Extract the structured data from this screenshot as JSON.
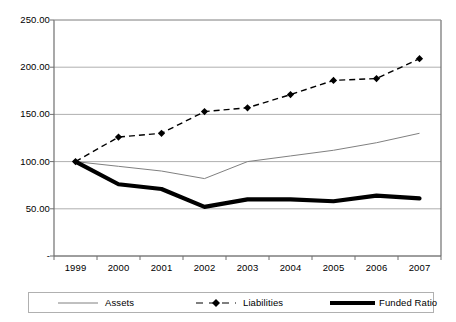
{
  "chart_data": {
    "type": "line",
    "title": "",
    "xlabel": "",
    "ylabel": "",
    "categories": [
      "1999",
      "2000",
      "2001",
      "2002",
      "2003",
      "2004",
      "2005",
      "2006",
      "2007"
    ],
    "ylim": [
      0,
      250
    ],
    "ytick_values": [
      0,
      50,
      100,
      150,
      200,
      250
    ],
    "ytick_labels": [
      "-",
      "50.00",
      "100.00",
      "150.00",
      "200.00",
      "250.00"
    ],
    "grid": true,
    "legend_position": "bottom",
    "series": [
      {
        "name": "Assets",
        "style": "thin-solid",
        "color": "#808080",
        "marker": "none",
        "values": [
          100,
          95,
          90,
          82,
          100,
          106,
          112,
          120,
          130
        ]
      },
      {
        "name": "Liabilities",
        "style": "dashed",
        "color": "#000000",
        "marker": "diamond",
        "values": [
          100,
          126,
          130,
          153,
          157,
          171,
          186,
          188,
          209
        ]
      },
      {
        "name": "Funded Ratio",
        "style": "thick-solid",
        "color": "#000000",
        "marker": "none",
        "values": [
          100,
          76,
          71,
          52,
          60,
          60,
          58,
          64,
          61
        ]
      }
    ]
  },
  "legend": {
    "items": [
      {
        "label": "Assets"
      },
      {
        "label": "Liabilities"
      },
      {
        "label": "Funded Ratio"
      }
    ]
  }
}
